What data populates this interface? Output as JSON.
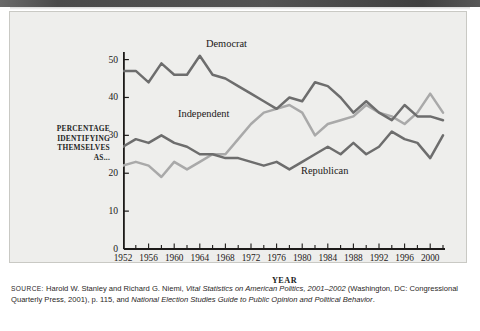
{
  "figure": {
    "y_axis_title_lines": [
      "PERCENTAGE",
      "IDENTIFYING",
      "THEMSELVES",
      "AS..."
    ],
    "x_axis_title": "YEAR",
    "series_labels": {
      "democrat": "Democrat",
      "independent": "Independent",
      "republican": "Republican"
    },
    "colors": {
      "plot_background": "#eeeeec",
      "axis": "#1c1a19",
      "democrat": "#6d6d6d",
      "republican": "#6d6d6d",
      "independent": "#a9a9a9",
      "text": "#1d1a19"
    }
  },
  "source_note": {
    "label": "SOURCE:",
    "part1": " Harold W. Stanley and Richard G. Niemi, ",
    "italic1": "Vital Statistics on American Politics, 2001–2002",
    "part2": " (Washington, DC: Congressional Quarterly Press, 2001), p. 115, and ",
    "italic2": "National Election Studies Guide to Public Opinion and Political Behavior",
    "part3": "."
  },
  "chart_data": {
    "type": "line",
    "title": "",
    "subtitle": "",
    "xlabel": "YEAR",
    "ylabel": "PERCENTAGE IDENTIFYING THEMSELVES AS...",
    "xlim": [
      1952,
      2002
    ],
    "ylim": [
      0,
      52
    ],
    "yticks": [
      0,
      10,
      20,
      30,
      40,
      50
    ],
    "xticks": [
      1952,
      1956,
      1960,
      1964,
      1968,
      1972,
      1976,
      1980,
      1984,
      1988,
      1992,
      1996,
      2000
    ],
    "xminor_step": 2,
    "grid": false,
    "legend": "inline-labels",
    "x": [
      1952,
      1954,
      1956,
      1958,
      1960,
      1962,
      1964,
      1966,
      1968,
      1970,
      1972,
      1974,
      1976,
      1978,
      1980,
      1982,
      1984,
      1986,
      1988,
      1990,
      1992,
      1994,
      1996,
      1998,
      2000,
      2002
    ],
    "series": [
      {
        "name": "Democrat",
        "color": "#6d6d6d",
        "values": [
          47,
          47,
          44,
          49,
          46,
          46,
          51,
          46,
          45,
          43,
          41,
          39,
          37,
          40,
          39,
          44,
          43,
          40,
          36,
          39,
          36,
          34,
          38,
          35,
          35,
          34
        ]
      },
      {
        "name": "Independent",
        "color": "#a9a9a9",
        "values": [
          22,
          23,
          22,
          19,
          23,
          21,
          23,
          25,
          25,
          29,
          33,
          36,
          37,
          38,
          36,
          30,
          33,
          34,
          35,
          38,
          36,
          35,
          33,
          36,
          41,
          36
        ]
      },
      {
        "name": "Republican",
        "color": "#6d6d6d",
        "values": [
          27,
          29,
          28,
          30,
          28,
          27,
          25,
          25,
          24,
          24,
          23,
          22,
          23,
          21,
          23,
          25,
          27,
          25,
          28,
          25,
          27,
          31,
          29,
          28,
          24,
          30
        ]
      }
    ]
  }
}
